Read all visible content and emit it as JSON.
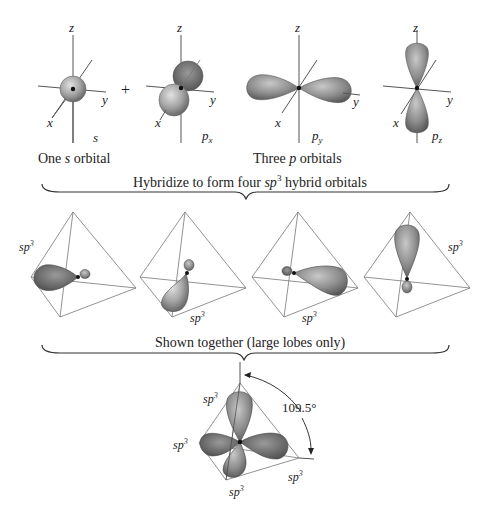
{
  "top_row": {
    "s_orbital": {
      "axis_z": "z",
      "axis_x": "x",
      "axis_y": "y",
      "label": "s"
    },
    "plus_sign": "+",
    "p_orbitals": [
      {
        "axis_z": "z",
        "axis_x": "x",
        "axis_y": "y",
        "label_base": "p",
        "label_sub": "x"
      },
      {
        "axis_z": "z",
        "axis_x": "x",
        "axis_y": "y",
        "label_base": "p",
        "label_sub": "y"
      },
      {
        "axis_z": "z",
        "axis_x": "x",
        "axis_y": "y",
        "label_base": "p",
        "label_sub": "z"
      }
    ],
    "caption_s": {
      "pre": "One ",
      "italic": "s",
      "post": " orbital"
    },
    "caption_p": {
      "pre": "Three ",
      "italic": "p",
      "post": " orbitals"
    }
  },
  "hybridize_caption": {
    "pre": "Hybridize to form four ",
    "italic": "sp",
    "sup": "3",
    "post": " hybrid orbitals"
  },
  "hybrids": [
    {
      "label_base": "sp",
      "label_sup": "3"
    },
    {
      "label_base": "sp",
      "label_sup": "3"
    },
    {
      "label_base": "sp",
      "label_sup": "3"
    },
    {
      "label_base": "sp",
      "label_sup": "3"
    }
  ],
  "together_caption": "Shown together (large lobes only)",
  "combined": {
    "angle_label": "109.5°",
    "labels": [
      "sp",
      "sp",
      "sp",
      "sp"
    ],
    "sup": "3"
  },
  "colors": {
    "lobe_dark": "#5a5a5a",
    "lobe_mid": "#9a9a9a",
    "lobe_light": "#d6d6d6",
    "lines": "#555555"
  }
}
